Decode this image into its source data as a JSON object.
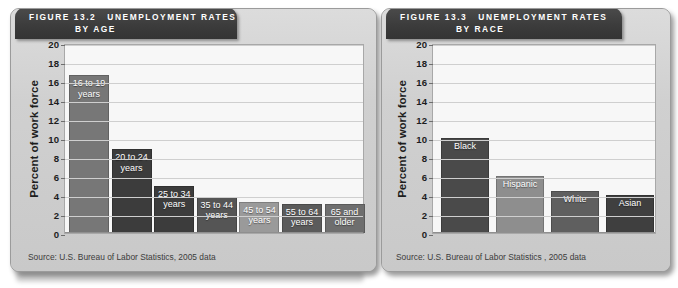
{
  "figures": [
    {
      "id": "age",
      "banner": {
        "figure_label": "FIGURE 13.2",
        "title_line1": "UNEMPLOYMENT RATES",
        "title_line2": "BY AGE"
      },
      "source": "Source: U.S. Bureau of Labor Statistics, 2005 data",
      "chart_data": {
        "type": "bar",
        "title": "FIGURE 13.2 UNEMPLOYMENT RATES BY AGE",
        "xlabel": "",
        "ylabel": "Percent of work force",
        "ylim": [
          0,
          20
        ],
        "ytick_step": 2,
        "yticks": [
          "20",
          "18",
          "16",
          "14",
          "12",
          "10",
          "8",
          "6",
          "4",
          "2",
          "0"
        ],
        "grid": true,
        "legend": "none",
        "categories": [
          "16 to 19 years",
          "20 to 24 years",
          "25 to 34 years",
          "35 to 44 years",
          "45 to 54 years",
          "55 to 64 years",
          "65 and older"
        ],
        "values": [
          16.6,
          8.8,
          5.0,
          3.8,
          3.3,
          3.1,
          3.1
        ],
        "bar_colors": [
          "#777777",
          "#3c3c3c",
          "#3c3c3c",
          "#555555",
          "#9a9a9a",
          "#5b5b5b",
          "#6e6e6e"
        ],
        "label_lines": [
          [
            "16 to 19",
            "years"
          ],
          [
            "20 to 24",
            "years"
          ],
          [
            "25 to 34",
            "years"
          ],
          [
            "35 to 44",
            "years"
          ],
          [
            "45 to 54",
            "years"
          ],
          [
            "55 to 64",
            "years"
          ],
          [
            "65 and",
            "older"
          ]
        ]
      }
    },
    {
      "id": "race",
      "banner": {
        "figure_label": "FIGURE 13.3",
        "title_line1": "UNEMPLOYMENT RATES",
        "title_line2": "BY RACE"
      },
      "source": "Source: U.S. Bureau of Labor Statistics , 2005 data",
      "chart_data": {
        "type": "bar",
        "title": "FIGURE 13.3 UNEMPLOYMENT RATES BY RACE",
        "xlabel": "",
        "ylabel": "Percent of work force",
        "ylim": [
          0,
          20
        ],
        "ytick_step": 2,
        "yticks": [
          "20",
          "18",
          "16",
          "14",
          "12",
          "10",
          "8",
          "6",
          "4",
          "2",
          "0"
        ],
        "grid": true,
        "legend": "none",
        "categories": [
          "Black",
          "Hispanic",
          "White",
          "Asian"
        ],
        "values": [
          10.0,
          6.0,
          4.4,
          4.0
        ],
        "bar_colors": [
          "#4a4a4a",
          "#8e8e8e",
          "#5f5f5f",
          "#3f3f3f"
        ],
        "label_lines": [
          [
            "Black"
          ],
          [
            "Hispanic"
          ],
          [
            "White"
          ],
          [
            "Asian"
          ]
        ]
      }
    }
  ],
  "colors": {
    "panel_bg": "#d2d2d2",
    "banner_bg": "#3c3c3c",
    "plot_bg": "#f7f7f7",
    "gridline": "#cfcfcf",
    "text": "#1d1d1d"
  }
}
